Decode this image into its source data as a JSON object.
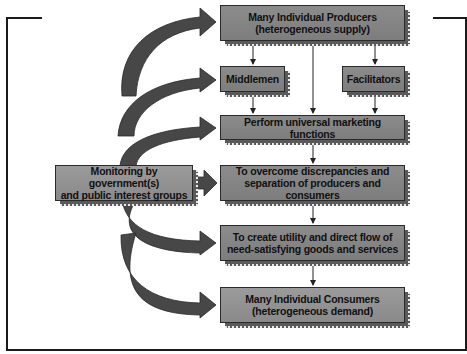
{
  "diagram": {
    "type": "marketing-system-flow",
    "colors": {
      "box_fill": "#858585",
      "box_shadow": "#5a5a5a",
      "arrow_fill": "#4a4a4a",
      "frame": "#1a1a1a"
    },
    "nodes": {
      "producers": {
        "line1": "Many Individual Producers",
        "line2": "(heterogeneous supply)"
      },
      "middlemen": {
        "line1": "Middlemen"
      },
      "facilitators": {
        "line1": "Facilitators"
      },
      "perform": {
        "line1": "Perform universal marketing functions"
      },
      "monitoring": {
        "line1": "Monitoring by government(s)",
        "line2": "and public interest groups"
      },
      "overcome": {
        "line1": "To overcome discrepancies and",
        "line2": "separation of producers and consumers"
      },
      "create": {
        "line1": "To create utility and direct flow of",
        "line2": "need-satisfying goods and services"
      },
      "consumers": {
        "line1": "Many Individual Consumers",
        "line2": "(heterogeneous demand)"
      }
    },
    "edges": [
      [
        "producers",
        "middlemen"
      ],
      [
        "producers",
        "facilitators"
      ],
      [
        "producers",
        "perform"
      ],
      [
        "middlemen",
        "perform"
      ],
      [
        "facilitators",
        "perform"
      ],
      [
        "perform",
        "overcome"
      ],
      [
        "overcome",
        "create"
      ],
      [
        "create",
        "consumers"
      ],
      [
        "monitoring",
        "producers"
      ],
      [
        "monitoring",
        "middlemen"
      ],
      [
        "monitoring",
        "perform"
      ],
      [
        "monitoring",
        "overcome"
      ],
      [
        "monitoring",
        "create"
      ],
      [
        "monitoring",
        "consumers"
      ]
    ]
  }
}
